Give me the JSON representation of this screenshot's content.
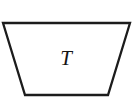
{
  "canvas": {
    "width": 132,
    "height": 108,
    "background_color": "#ffffff"
  },
  "figure": {
    "kind": "geometric-diagram",
    "shape_name": "trapezoid",
    "stroke_color": "#1c1c1c",
    "stroke_width": 2.3,
    "fill_color": "#ffffff",
    "vertices": [
      {
        "name": "top-left",
        "x": 3,
        "y": 23
      },
      {
        "name": "top-right",
        "x": 130,
        "y": 23
      },
      {
        "name": "bottom-right",
        "x": 108,
        "y": 95
      },
      {
        "name": "bottom-left",
        "x": 25,
        "y": 95
      }
    ],
    "points_string": "3,23 130,23 108,95 25,95",
    "label": {
      "text": "T",
      "style": "italic-serif",
      "color": "#141414",
      "font_size": 21,
      "x": 66,
      "y": 65
    }
  }
}
